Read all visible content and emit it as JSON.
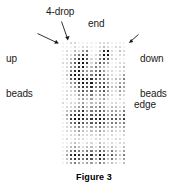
{
  "figure": {
    "caption": "Figure 3",
    "labels": {
      "four_drop": "4-drop",
      "end": "end",
      "up_beads": "up\nbeads",
      "up_beads_line1": "up",
      "up_beads_line2": "beads",
      "down_beads_line1": "down",
      "down_beads_line2": "beads",
      "edge": "edge"
    }
  },
  "colors": {
    "background": "#ffffff",
    "text": "#1a1a1a",
    "caption": "#000000",
    "arrow": "#1a1a1a",
    "grout": "#ffffff",
    "bead_palette": [
      "#f2f2f2",
      "#d9d9d9",
      "#bdbdbd",
      "#9e9e9e",
      "#7a7a7a",
      "#585858",
      "#343434",
      "#141414"
    ]
  },
  "bead_grid": {
    "columns": 16,
    "rows": 31,
    "cell_size_px": 4,
    "x_px": 61,
    "y_px": 41,
    "width_px": 65,
    "height_px": 124,
    "legend": "digits 0-7 index colors.bead_palette, 0 = lightest, 7 = darkest",
    "cells": [
      "0011000001110000",
      "0001011001210110",
      "0102134002671021",
      "0113465013771011",
      "0124675114651100",
      "1135776135430011",
      "0134673243210112",
      "0146743345311011",
      "0267654456421013",
      "0156776654431224",
      "0134676745531133",
      "0023565645642243",
      "0112454534531132",
      "0111343423421021",
      "0100232312310010",
      "1011231223201101",
      "0112342334312212",
      "0234563445423324",
      "0356674556534435",
      "0267765667645546",
      "0145654556534434",
      "0123432334323223",
      "0112321223212112",
      "0011211112101001",
      "0101110011010110",
      "0012101102101011",
      "0123212213212102",
      "0245434435424213",
      "0367656647635324",
      "0256545536524213",
      "0134323324312102"
    ]
  }
}
